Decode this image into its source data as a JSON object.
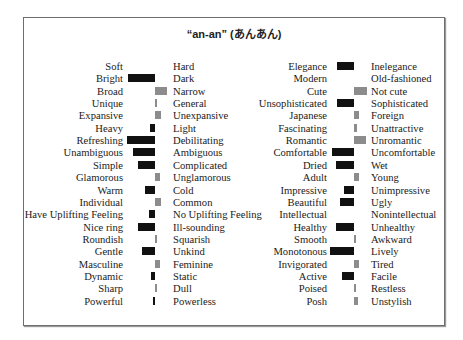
{
  "chart_data": {
    "type": "bar",
    "title": "“an-an” (あんあん)",
    "xlabel": "",
    "ylabel": "",
    "orientation": "horizontal diverging",
    "legend": "none; black bars extend toward left adjective, grey bars toward right adjective",
    "grid": false,
    "units": "relative bar length (px, negative = left/black, positive = right/grey)",
    "colors": {
      "left": "#111111",
      "right": "#8c8c8c"
    },
    "panels": [
      {
        "pairs": [
          {
            "left": "Soft",
            "right": "Hard",
            "value": 0
          },
          {
            "left": "Bright",
            "right": "Dark",
            "value": -27
          },
          {
            "left": "Broad",
            "right": "Narrow",
            "value": 12
          },
          {
            "left": "Unique",
            "right": "General",
            "value": 2
          },
          {
            "left": "Expansive",
            "right": "Unexpansive",
            "value": 6
          },
          {
            "left": "Heavy",
            "right": "Light",
            "value": -5
          },
          {
            "left": "Refreshing",
            "right": "Debilitating",
            "value": -28
          },
          {
            "left": "Unambiguous",
            "right": "Ambiguous",
            "value": -22
          },
          {
            "left": "Simple",
            "right": "Complicated",
            "value": -17
          },
          {
            "left": "Glamorous",
            "right": "Unglamorous",
            "value": 5
          },
          {
            "left": "Warm",
            "right": "Cold",
            "value": -10
          },
          {
            "left": "Individual",
            "right": "Common",
            "value": 6
          },
          {
            "left": "Have Uplifting Feeling",
            "right": "No Uplifting Feeling",
            "value": -6
          },
          {
            "left": "Nice ring",
            "right": "Ill-sounding",
            "value": -17
          },
          {
            "left": "Roundish",
            "right": "Squarish",
            "value": 1
          },
          {
            "left": "Gentle",
            "right": "Unkind",
            "value": -13
          },
          {
            "left": "Masculine",
            "right": "Feminine",
            "value": 5
          },
          {
            "left": "Dynamic",
            "right": "Static",
            "value": -4
          },
          {
            "left": "Sharp",
            "right": "Dull",
            "value": 1
          },
          {
            "left": "Powerful",
            "right": "Powerless",
            "value": -2
          }
        ]
      },
      {
        "pairs": [
          {
            "left": "Elegance",
            "right": "Inelegance",
            "value": -17
          },
          {
            "left": "Modern",
            "right": "Old-fashioned",
            "value": 0
          },
          {
            "left": "Cute",
            "right": "Not cute",
            "value": 13
          },
          {
            "left": "Unsophisticated",
            "right": "Sophisticated",
            "value": -17
          },
          {
            "left": "Japanese",
            "right": "Foreign",
            "value": 5
          },
          {
            "left": "Fascinating",
            "right": "Unattractive",
            "value": 3
          },
          {
            "left": "Romantic",
            "right": "Unromantic",
            "value": 12
          },
          {
            "left": "Comfortable",
            "right": "Uncomfortable",
            "value": -22
          },
          {
            "left": "Dried",
            "right": "Wet",
            "value": -18
          },
          {
            "left": "Adult",
            "right": "Young",
            "value": 5
          },
          {
            "left": "Impressive",
            "right": "Unimpressive",
            "value": -10
          },
          {
            "left": "Beautiful",
            "right": "Ugly",
            "value": -14
          },
          {
            "left": "Intellectual",
            "right": "Nonintellectual",
            "value": 0
          },
          {
            "left": "Healthy",
            "right": "Unhealthy",
            "value": -18
          },
          {
            "left": "Smooth",
            "right": "Awkward",
            "value": 2
          },
          {
            "left": "Monotonous",
            "right": "Lively",
            "value": -24
          },
          {
            "left": "Invigorated",
            "right": "Tired",
            "value": 5
          },
          {
            "left": "Active",
            "right": "Facile",
            "value": -12
          },
          {
            "left": "Poised",
            "right": "Restless",
            "value": 2
          },
          {
            "left": "Posh",
            "right": "Unstylish",
            "value": 4
          }
        ]
      }
    ]
  },
  "layout": {
    "row_height": 12.35,
    "panels": [
      {
        "label_right_edge": 123,
        "center": 155,
        "right_label_x": 173
      },
      {
        "label_right_edge": 327,
        "center": 354,
        "right_label_x": 371
      }
    ]
  }
}
